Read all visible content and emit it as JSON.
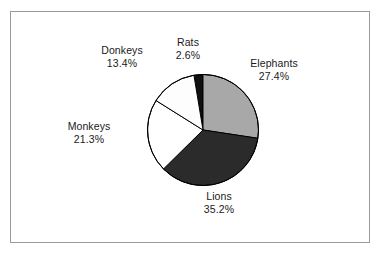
{
  "figure": {
    "background_color": "#ffffff",
    "frame_color": "#9a9a9a",
    "text_color": "#1a1a1a"
  },
  "chart_data": {
    "type": "pie",
    "title": "",
    "xlabel": "",
    "ylabel": "",
    "legend_position": "none",
    "grid": false,
    "labels_inline": true,
    "start_angle_deg": -9.4,
    "direction": "clockwise",
    "categories": [
      "Rats",
      "Elephants",
      "Lions",
      "Monkeys",
      "Donkeys"
    ],
    "values": [
      2.6,
      27.4,
      35.2,
      21.3,
      13.4
    ],
    "value_unit": "%",
    "slices": [
      {
        "name": "Rats",
        "value": 2.6,
        "value_label": "2.6%",
        "color": "#101010",
        "start_deg": -9.4,
        "end_deg": 0.0
      },
      {
        "name": "Elephants",
        "value": 27.4,
        "value_label": "27.4%",
        "color": "#a8a8a8",
        "start_deg": 0.0,
        "end_deg": 98.6
      },
      {
        "name": "Lions",
        "value": 35.2,
        "value_label": "35.2%",
        "color": "#2b2b2b",
        "start_deg": 98.6,
        "end_deg": 225.4
      },
      {
        "name": "Monkeys",
        "value": 21.3,
        "value_label": "21.3%",
        "color": "#ffffff",
        "start_deg": 225.4,
        "end_deg": 302.1
      },
      {
        "name": "Donkeys",
        "value": 13.4,
        "value_label": "13.4%",
        "color": "#fdfdfd",
        "start_deg": 302.1,
        "end_deg": 350.6
      }
    ]
  },
  "labels": {
    "donkeys": {
      "name": "Donkeys",
      "value": "13.4%"
    },
    "rats": {
      "name": "Rats",
      "value": "2.6%"
    },
    "elephants": {
      "name": "Elephants",
      "value": "27.4%"
    },
    "monkeys": {
      "name": "Monkeys",
      "value": "21.3%"
    },
    "lions": {
      "name": "Lions",
      "value": "35.2%"
    }
  }
}
